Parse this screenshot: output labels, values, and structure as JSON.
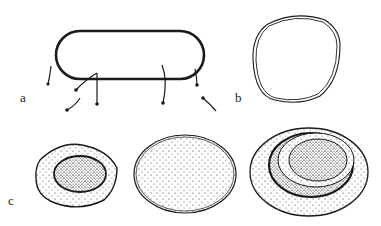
{
  "figure": {
    "panels": [
      {
        "id": "a",
        "label": "a",
        "description": "rod-shaped bacterium with scattered flagella"
      },
      {
        "id": "b",
        "label": "b",
        "description": "rounded cell outline with double wall"
      },
      {
        "id": "c",
        "label": "c",
        "description": "three stippled cells: nucleated small cell, uniform oval cell, cell with concentric rings"
      }
    ],
    "colors": {
      "ink": "#1a1a1a",
      "paper": "#ffffff"
    }
  }
}
